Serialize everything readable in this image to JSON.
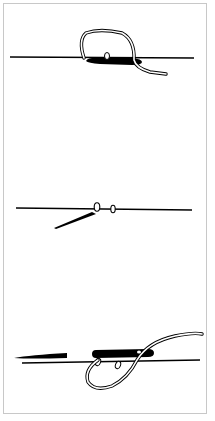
{
  "figure": {
    "title": "",
    "colors": {
      "ink": "#000000",
      "frame": "#c8c8c8",
      "background": "#ffffff"
    },
    "panels": [
      {
        "step": 1,
        "label": "",
        "elements": [
          "fabric-line",
          "needle-under-fabric",
          "thread-loop-over",
          "thread-tail"
        ]
      },
      {
        "step": 2,
        "label": "",
        "elements": [
          "fabric-line",
          "needle-diagonal",
          "stitch-bead-1",
          "stitch-bead-2"
        ]
      },
      {
        "step": 3,
        "label": "",
        "elements": [
          "fabric-line",
          "needle-tip-left",
          "needle-body",
          "stitch-bead-1",
          "stitch-bead-2",
          "thread-loop-under"
        ]
      }
    ]
  }
}
